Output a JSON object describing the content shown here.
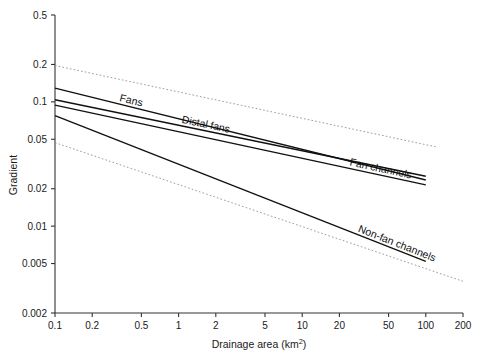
{
  "chart_data": {
    "type": "line",
    "title": "",
    "xlabel": "Drainage area (km2)",
    "xlabel_base": "Drainage area (km",
    "xlabel_sup": "2",
    "xlabel_tail": ")",
    "ylabel": "Gradient",
    "xscale": "log",
    "yscale": "log",
    "xlim": [
      0.1,
      200
    ],
    "ylim": [
      0.002,
      0.5
    ],
    "grid": false,
    "legend_position": "inline-labels",
    "xticks": [
      0.1,
      0.2,
      0.5,
      1,
      2,
      5,
      10,
      20,
      50,
      100,
      200
    ],
    "xticklabels": [
      "0.1",
      "0.2",
      "0.5",
      "1",
      "2",
      "5",
      "10",
      "20",
      "50",
      "100",
      "200"
    ],
    "yticks": [
      0.002,
      0.005,
      0.01,
      0.02,
      0.05,
      0.1,
      0.2,
      0.5
    ],
    "yticklabels": [
      "0.002",
      "0.005",
      "0.01",
      "0.02",
      "0.05",
      "0.1",
      "0.2",
      "0.5"
    ],
    "series": [
      {
        "name": "Fans",
        "style": "solid",
        "color": "#111111",
        "label": "Fans",
        "x": [
          0.1,
          100
        ],
        "y": [
          0.129,
          0.0235
        ]
      },
      {
        "name": "Distal fans",
        "style": "solid",
        "color": "#111111",
        "label": "Distal fans",
        "x": [
          0.1,
          100
        ],
        "y": [
          0.104,
          0.0252
        ]
      },
      {
        "name": "Fan channels",
        "style": "solid",
        "color": "#111111",
        "label": "Fan channels",
        "x": [
          0.1,
          100
        ],
        "y": [
          0.094,
          0.0215
        ]
      },
      {
        "name": "Non-fan channels",
        "style": "solid",
        "color": "#111111",
        "label": "Non-fan channels",
        "x": [
          0.1,
          100
        ],
        "y": [
          0.0775,
          0.0052
        ]
      },
      {
        "name": "Upper envelope",
        "style": "dotted",
        "color": "#8e8e8e",
        "label": "",
        "x": [
          0.1,
          120
        ],
        "y": [
          0.196,
          0.0435
        ]
      },
      {
        "name": "Lower envelope",
        "style": "dotted",
        "color": "#8e8e8e",
        "label": "",
        "x": [
          0.1,
          200
        ],
        "y": [
          0.047,
          0.0036
        ]
      }
    ],
    "annotations": [
      {
        "text": "Fans",
        "series": "Fans",
        "at_x": 0.33
      },
      {
        "text": "Distal fans",
        "series": "Distal fans",
        "at_x": 1.05
      },
      {
        "text": "Fan channels",
        "series": "Fan channels",
        "at_x": 24
      },
      {
        "text": "Non-fan channels",
        "series": "Non-fan channels",
        "at_x": 28
      }
    ]
  }
}
